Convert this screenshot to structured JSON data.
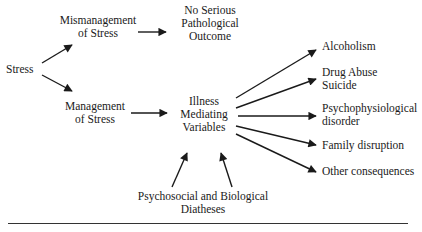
{
  "diagram": {
    "nodes": {
      "stress": "Stress",
      "mismanagement": [
        "Mismanagement",
        "of Stress"
      ],
      "no_outcome": [
        "No Serious",
        "Pathological",
        "Outcome"
      ],
      "management": [
        "Management",
        "of Stress"
      ],
      "mediating": [
        "Illness",
        "Mediating",
        "Variables"
      ],
      "diatheses": [
        "Psychosocial and Biological",
        "Diatheses"
      ],
      "outcomes": {
        "alcoholism": [
          "Alcoholism"
        ],
        "drug_abuse": [
          "Drug Abuse",
          "Suicide"
        ],
        "psychophysiological": [
          "Psychophysiological",
          "disorder"
        ],
        "family": [
          "Family disruption"
        ],
        "other": [
          "Other consequences"
        ]
      }
    },
    "edges": [
      {
        "from": "Stress",
        "to": "Mismanagement of Stress"
      },
      {
        "from": "Stress",
        "to": "Management of Stress"
      },
      {
        "from": "Mismanagement of Stress",
        "to": "No Serious Pathological Outcome"
      },
      {
        "from": "Management of Stress",
        "to": "Illness Mediating Variables"
      },
      {
        "from": "Psychosocial and Biological Diatheses",
        "to": "Illness Mediating Variables"
      },
      {
        "from": "Psychosocial and Biological Diatheses",
        "to": "Illness Mediating Variables"
      },
      {
        "from": "Illness Mediating Variables",
        "to": "Alcoholism"
      },
      {
        "from": "Illness Mediating Variables",
        "to": "Drug Abuse Suicide"
      },
      {
        "from": "Illness Mediating Variables",
        "to": "Psychophysiological disorder"
      },
      {
        "from": "Illness Mediating Variables",
        "to": "Family disruption"
      },
      {
        "from": "Illness Mediating Variables",
        "to": "Other consequences"
      }
    ],
    "colors": {
      "ink": "#1a1a1a",
      "background": "#ffffff"
    }
  }
}
